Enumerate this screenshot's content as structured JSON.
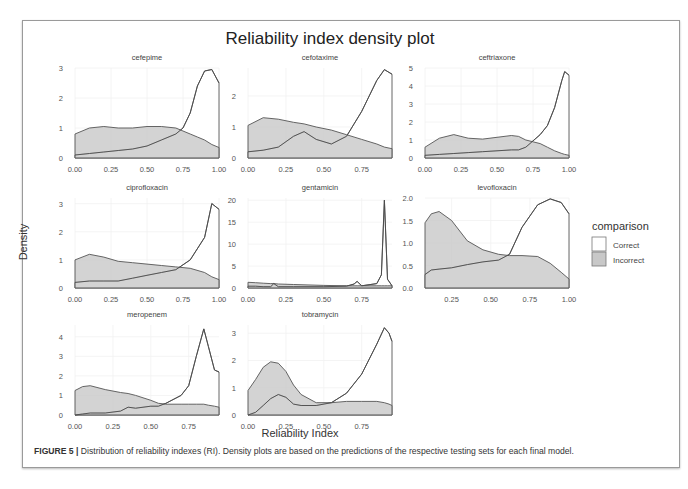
{
  "figure": {
    "title": "Reliability index density plot",
    "xlabel": "Reliability Index",
    "ylabel": "Density",
    "caption_label": "FIGURE 5 |",
    "caption_text": " Distribution of reliability indexes (RI). Density plots are based on the predictions of the respective testing sets for each final model."
  },
  "legend": {
    "title": "comparison",
    "items": [
      {
        "label": "Correct",
        "fill": "#ffffff"
      },
      {
        "label": "Incorrect",
        "fill": "#c8c8c8"
      }
    ]
  },
  "colors": {
    "correct_fill": "#ffffff",
    "incorrect_fill": "#c8c8c8",
    "line": "#555555",
    "text": "#444444"
  },
  "chart_data": {
    "type": "area",
    "title": "Reliability index density plot",
    "xlabel": "Reliability Index",
    "ylabel": "Density",
    "legend_title": "comparison",
    "legend_position": "right",
    "grid": true,
    "series_names": [
      "Correct",
      "Incorrect"
    ],
    "panels": [
      {
        "name": "cefepime",
        "xlim": [
          0.0,
          1.0
        ],
        "xticks": [
          "0.00",
          "0.25",
          "0.50",
          "0.75",
          "1.00"
        ],
        "xtick_vals": [
          0,
          0.25,
          0.5,
          0.75,
          1.0
        ],
        "ylim": [
          0,
          3.0
        ],
        "yticks": [
          "0",
          "1",
          "2",
          "3"
        ],
        "ytick_vals": [
          0,
          1,
          2,
          3
        ],
        "x": [
          0.0,
          0.1,
          0.2,
          0.3,
          0.4,
          0.5,
          0.6,
          0.7,
          0.75,
          0.8,
          0.85,
          0.9,
          0.95,
          1.0
        ],
        "correct": [
          0.1,
          0.15,
          0.2,
          0.25,
          0.3,
          0.4,
          0.6,
          0.8,
          1.0,
          1.5,
          2.4,
          2.9,
          2.95,
          2.5
        ],
        "incorrect": [
          0.8,
          1.0,
          1.05,
          1.0,
          1.0,
          1.05,
          1.05,
          1.0,
          0.9,
          0.8,
          0.7,
          0.6,
          0.45,
          0.35
        ]
      },
      {
        "name": "cefotaxime",
        "xlim": [
          0.0,
          0.95
        ],
        "xticks": [
          "0.00",
          "0.25",
          "0.50",
          "0.75"
        ],
        "xtick_vals": [
          0,
          0.25,
          0.5,
          0.75
        ],
        "ylim": [
          0,
          2.9
        ],
        "yticks": [
          "0",
          "1",
          "2"
        ],
        "ytick_vals": [
          0,
          1,
          2
        ],
        "x": [
          0.0,
          0.1,
          0.2,
          0.3,
          0.37,
          0.45,
          0.55,
          0.65,
          0.75,
          0.85,
          0.9,
          0.95
        ],
        "correct": [
          0.2,
          0.25,
          0.35,
          0.7,
          0.85,
          0.6,
          0.45,
          0.7,
          1.5,
          2.5,
          2.85,
          2.7
        ],
        "incorrect": [
          1.05,
          1.3,
          1.25,
          1.15,
          1.1,
          1.0,
          0.9,
          0.75,
          0.6,
          0.45,
          0.35,
          0.3
        ]
      },
      {
        "name": "ceftriaxone",
        "xlim": [
          0.0,
          1.0
        ],
        "xticks": [
          "0.00",
          "0.25",
          "0.50",
          "0.75",
          "1.00"
        ],
        "xtick_vals": [
          0,
          0.25,
          0.5,
          0.75,
          1.0
        ],
        "ylim": [
          0,
          5.0
        ],
        "yticks": [
          "0",
          "1",
          "2",
          "3",
          "4",
          "5"
        ],
        "ytick_vals": [
          0,
          1,
          2,
          3,
          4,
          5
        ],
        "x": [
          0.0,
          0.1,
          0.2,
          0.3,
          0.4,
          0.5,
          0.6,
          0.65,
          0.7,
          0.8,
          0.85,
          0.9,
          0.95,
          0.97,
          1.0
        ],
        "correct": [
          0.15,
          0.2,
          0.25,
          0.3,
          0.35,
          0.4,
          0.45,
          0.45,
          0.6,
          1.3,
          1.8,
          2.8,
          4.3,
          4.8,
          4.6
        ],
        "incorrect": [
          0.6,
          1.1,
          1.3,
          1.1,
          1.05,
          1.15,
          1.25,
          1.2,
          1.0,
          0.8,
          0.6,
          0.4,
          0.25,
          0.2,
          0.15
        ]
      },
      {
        "name": "ciprofloxacin",
        "xlim": [
          0.0,
          1.0
        ],
        "xticks": [
          "0.00",
          "0.25",
          "0.50",
          "0.75",
          "1.00"
        ],
        "xtick_vals": [
          0,
          0.25,
          0.5,
          0.75,
          1.0
        ],
        "ylim": [
          0,
          3.2
        ],
        "yticks": [
          "0",
          "1",
          "2",
          "3"
        ],
        "ytick_vals": [
          0,
          1,
          2,
          3
        ],
        "x": [
          0.0,
          0.1,
          0.2,
          0.3,
          0.4,
          0.5,
          0.6,
          0.7,
          0.8,
          0.9,
          0.95,
          1.0
        ],
        "correct": [
          0.2,
          0.25,
          0.25,
          0.25,
          0.35,
          0.45,
          0.55,
          0.65,
          1.0,
          1.8,
          3.0,
          2.8
        ],
        "incorrect": [
          1.0,
          1.2,
          1.1,
          0.95,
          0.9,
          0.85,
          0.8,
          0.75,
          0.7,
          0.55,
          0.4,
          0.3
        ]
      },
      {
        "name": "gentamicin",
        "xlim": [
          0.0,
          0.95
        ],
        "xticks": [
          "0.00",
          "0.25",
          "0.50",
          "0.75"
        ],
        "xtick_vals": [
          0,
          0.25,
          0.5,
          0.75
        ],
        "ylim": [
          0,
          20.5
        ],
        "yticks": [
          "0",
          "5",
          "10",
          "15",
          "20"
        ],
        "ytick_vals": [
          0,
          5,
          10,
          15,
          20
        ],
        "x": [
          0.0,
          0.05,
          0.1,
          0.15,
          0.17,
          0.2,
          0.3,
          0.5,
          0.65,
          0.7,
          0.72,
          0.75,
          0.85,
          0.88,
          0.9,
          0.92,
          0.95
        ],
        "correct": [
          0.4,
          0.4,
          0.3,
          0.3,
          1.0,
          0.3,
          0.3,
          0.3,
          0.4,
          0.9,
          1.5,
          0.5,
          1.0,
          3.0,
          20.0,
          2.0,
          0.5
        ],
        "incorrect": [
          1.3,
          1.2,
          1.1,
          1.0,
          1.0,
          0.9,
          0.8,
          0.6,
          0.5,
          0.5,
          0.5,
          0.5,
          0.5,
          0.5,
          0.5,
          0.5,
          0.5
        ]
      },
      {
        "name": "levofloxacin",
        "xlim": [
          0.08,
          1.0
        ],
        "xticks": [
          "0.25",
          "0.50",
          "0.75",
          "1.00"
        ],
        "xtick_vals": [
          0.25,
          0.5,
          0.75,
          1.0
        ],
        "ylim": [
          0,
          2.0
        ],
        "yticks": [
          "0.0",
          "0.5",
          "1.0",
          "1.5",
          "2.0"
        ],
        "ytick_vals": [
          0,
          0.5,
          1.0,
          1.5,
          2.0
        ],
        "x": [
          0.08,
          0.12,
          0.17,
          0.25,
          0.35,
          0.45,
          0.55,
          0.62,
          0.7,
          0.8,
          0.88,
          0.95,
          1.0
        ],
        "correct": [
          0.3,
          0.4,
          0.42,
          0.45,
          0.52,
          0.58,
          0.62,
          0.75,
          1.35,
          1.85,
          1.98,
          1.9,
          1.65
        ],
        "incorrect": [
          1.45,
          1.65,
          1.7,
          1.5,
          1.05,
          0.85,
          0.75,
          0.72,
          0.72,
          0.7,
          0.55,
          0.35,
          0.2
        ]
      },
      {
        "name": "meropenem",
        "xlim": [
          0.0,
          0.95
        ],
        "xticks": [
          "0.00",
          "0.25",
          "0.50",
          "0.75"
        ],
        "xtick_vals": [
          0,
          0.25,
          0.5,
          0.75
        ],
        "ylim": [
          0,
          4.6
        ],
        "yticks": [
          "0",
          "1",
          "2",
          "3",
          "4"
        ],
        "ytick_vals": [
          0,
          1,
          2,
          3,
          4
        ],
        "x": [
          0.0,
          0.05,
          0.1,
          0.2,
          0.3,
          0.35,
          0.4,
          0.5,
          0.55,
          0.6,
          0.7,
          0.75,
          0.8,
          0.85,
          0.88,
          0.92,
          0.95
        ],
        "correct": [
          0.0,
          0.05,
          0.1,
          0.1,
          0.2,
          0.4,
          0.35,
          0.45,
          0.45,
          0.6,
          1.0,
          1.5,
          3.0,
          4.4,
          3.5,
          2.3,
          2.2
        ],
        "incorrect": [
          1.25,
          1.45,
          1.5,
          1.3,
          1.15,
          1.1,
          1.0,
          0.75,
          0.6,
          0.55,
          0.55,
          0.55,
          0.55,
          0.55,
          0.5,
          0.45,
          0.4
        ]
      },
      {
        "name": "tobramycin",
        "xlim": [
          0.0,
          0.95
        ],
        "xticks": [
          "0.00",
          "0.25",
          "0.50",
          "0.75"
        ],
        "xtick_vals": [
          0,
          0.25,
          0.5,
          0.75
        ],
        "ylim": [
          0,
          3.3
        ],
        "yticks": [
          "0",
          "1",
          "2",
          "3"
        ],
        "ytick_vals": [
          0,
          1,
          2,
          3
        ],
        "x": [
          0.0,
          0.05,
          0.1,
          0.15,
          0.2,
          0.25,
          0.3,
          0.35,
          0.45,
          0.55,
          0.65,
          0.75,
          0.85,
          0.9,
          0.93,
          0.95
        ],
        "correct": [
          0.0,
          0.1,
          0.35,
          0.6,
          0.75,
          0.65,
          0.4,
          0.35,
          0.35,
          0.45,
          0.8,
          1.5,
          2.6,
          3.2,
          3.0,
          2.7
        ],
        "incorrect": [
          0.9,
          1.3,
          1.75,
          1.95,
          1.9,
          1.6,
          1.1,
          0.75,
          0.45,
          0.45,
          0.5,
          0.5,
          0.5,
          0.45,
          0.4,
          0.35
        ]
      }
    ]
  }
}
